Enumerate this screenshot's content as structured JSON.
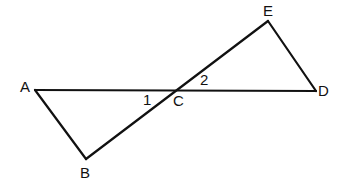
{
  "diagram": {
    "type": "geometry",
    "points": {
      "A": {
        "label": "A",
        "x": 35,
        "y": 90
      },
      "B": {
        "label": "B",
        "x": 86,
        "y": 159
      },
      "C": {
        "label": "C",
        "x": 176,
        "y": 90
      },
      "D": {
        "label": "D",
        "x": 316,
        "y": 91
      },
      "E": {
        "label": "E",
        "x": 268,
        "y": 21
      }
    },
    "segments": [
      "AD",
      "BE",
      "AB",
      "ED"
    ],
    "angles": {
      "angle1": {
        "label": "1"
      },
      "angle2": {
        "label": "2"
      }
    }
  }
}
